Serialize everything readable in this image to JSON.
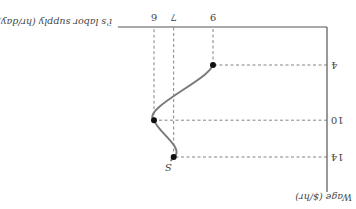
{
  "chart_data": {
    "type": "line",
    "title": "",
    "xlabel": "i's labor supply (hr/day)",
    "ylabel": "Wage ($/hr)",
    "x_ticks": [
      6,
      7,
      9
    ],
    "y_ticks": [
      4,
      10,
      14
    ],
    "xlim": [
      0,
      10
    ],
    "ylim": [
      0,
      16
    ],
    "grid": false,
    "orientation": "rotated 180 degrees",
    "series": [
      {
        "name": "S",
        "label": "S",
        "points": [
          {
            "x": 9,
            "y": 4
          },
          {
            "x": 6,
            "y": 10
          },
          {
            "x": 7,
            "y": 14
          }
        ]
      }
    ],
    "x_tick_labels": [
      "6",
      "7",
      "9"
    ],
    "y_tick_labels": [
      "4",
      "10",
      "14"
    ],
    "curve_label": "S"
  }
}
